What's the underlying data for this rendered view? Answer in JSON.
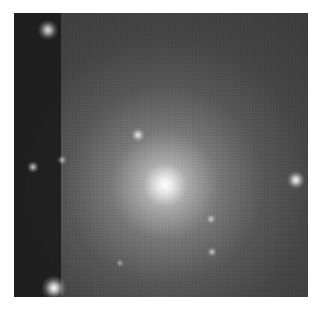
{
  "image": {
    "description": "Grayscale astronomical image of an elliptical galaxy with a bright central core, surrounded by foreground stars; a darker vertical strip on the left edge",
    "frame": {
      "left": 14,
      "top": 13,
      "width": 294,
      "height": 284
    },
    "colors": {
      "background": "#3c3c3c",
      "strip": "#1c1c1c",
      "core": "#ffffff",
      "halo": "#9a9a9a"
    },
    "galaxy_core": {
      "x": 151,
      "y": 172
    },
    "stars": [
      {
        "name": "star-top-left",
        "x": 34,
        "y": 17,
        "r": 5,
        "brightness": 0.85
      },
      {
        "name": "star-bottom-left",
        "x": 40,
        "y": 275,
        "r": 6,
        "brightness": 1.0
      },
      {
        "name": "star-left-mid",
        "x": 19,
        "y": 154,
        "r": 3,
        "brightness": 0.7
      },
      {
        "name": "star-strip-edge",
        "x": 48,
        "y": 147,
        "r": 2.5,
        "brightness": 0.55
      },
      {
        "name": "star-upper-center",
        "x": 124,
        "y": 122,
        "r": 3.5,
        "brightness": 0.8
      },
      {
        "name": "star-right",
        "x": 282,
        "y": 167,
        "r": 4.5,
        "brightness": 0.95
      },
      {
        "name": "star-lower-center-1",
        "x": 197,
        "y": 206,
        "r": 2.5,
        "brightness": 0.6
      },
      {
        "name": "star-lower-center-2",
        "x": 198,
        "y": 239,
        "r": 2.5,
        "brightness": 0.6
      },
      {
        "name": "star-lower-left",
        "x": 106,
        "y": 250,
        "r": 2,
        "brightness": 0.45
      }
    ]
  }
}
